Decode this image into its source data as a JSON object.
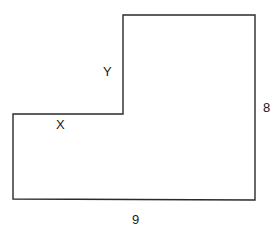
{
  "figure": {
    "shape": "L-shaped polygon",
    "stroke_color": "#2a2a2a",
    "background": "#ffffff",
    "vertices": [
      [
        123,
        15
      ],
      [
        255,
        15
      ],
      [
        255,
        200
      ],
      [
        13,
        199
      ],
      [
        13,
        114
      ],
      [
        123,
        114
      ]
    ],
    "labels": {
      "right_side": "8",
      "bottom_side": "9",
      "step_horizontal": "X",
      "step_vertical": "Y"
    }
  }
}
